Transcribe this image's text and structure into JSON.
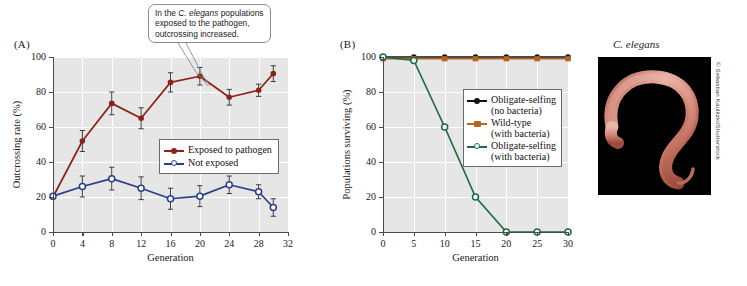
{
  "figure": {
    "panel_a_label": "(A)",
    "panel_b_label": "(B)",
    "photo_title": "C. elegans",
    "photo_credit": "© Sebastian Kaulitzki/Shutterstock",
    "callout": {
      "line1_pre": "In the ",
      "line1_italic": "C. elegans",
      "line1_post": " populations",
      "line2": "exposed to the pathogen,",
      "line3": "outcrossing increased."
    }
  },
  "colors": {
    "exposed_red": "#8c2318",
    "not_exposed_blue": "#27408b",
    "obligate_no_bacteria_black": "#111111",
    "wildtype_brown": "#b5651d",
    "obligate_with_bacteria_green": "#1f6b43",
    "plot_background": "#e6e6e6",
    "gridline": "#ffffff",
    "axis": "#4a4a4a",
    "photo_background": "#000000"
  },
  "chart_data": [
    {
      "id": "panel-a",
      "type": "line",
      "title": "",
      "xlabel": "Generation",
      "ylabel": "Outcrossing rate (%)",
      "xlim": [
        0,
        32
      ],
      "ylim": [
        0,
        100
      ],
      "xticks": [
        0,
        4,
        8,
        12,
        16,
        20,
        24,
        28,
        32
      ],
      "yticks": [
        0,
        20,
        40,
        60,
        80,
        100
      ],
      "grid": true,
      "legend_position": "center-right",
      "x": [
        0,
        4,
        8,
        12,
        16,
        20,
        24,
        28,
        30
      ],
      "series": [
        {
          "name": "Exposed to pathogen",
          "color": "#8c2318",
          "marker": "filled-circle",
          "values": [
            20,
            52,
            73.5,
            65,
            85.5,
            89,
            77,
            81,
            90.5
          ],
          "errors": [
            1,
            6,
            6.5,
            6,
            5.5,
            5,
            4.5,
            3.5,
            4.5
          ]
        },
        {
          "name": "Not exposed",
          "color": "#27408b",
          "marker": "open-circle",
          "values": [
            20.5,
            26,
            30.5,
            25,
            19,
            20.5,
            27,
            23,
            14
          ],
          "errors": [
            1,
            6,
            6.5,
            6.5,
            6,
            6,
            5,
            4,
            5
          ]
        }
      ]
    },
    {
      "id": "panel-b",
      "type": "line",
      "title": "",
      "xlabel": "Generation",
      "ylabel": "Populations surviving (%)",
      "xlim": [
        0,
        30
      ],
      "ylim": [
        0,
        100
      ],
      "xticks": [
        0,
        5,
        10,
        15,
        20,
        25,
        30
      ],
      "yticks": [
        0,
        20,
        40,
        60,
        80,
        100
      ],
      "grid": true,
      "legend_position": "center-right",
      "x": [
        0,
        5,
        10,
        15,
        20,
        25,
        30
      ],
      "series": [
        {
          "name": "Obligate-selfing",
          "sub": "(no bacteria)",
          "color": "#111111",
          "marker": "filled-circle",
          "values": [
            100,
            100,
            100,
            100,
            100,
            100,
            100
          ]
        },
        {
          "name": "Wild-type",
          "sub": "(with bacteria)",
          "color": "#b5651d",
          "marker": "filled-square",
          "values": [
            99,
            99,
            99,
            99,
            99,
            99,
            99
          ]
        },
        {
          "name": "Obligate-selfing",
          "sub": "(with bacteria)",
          "color": "#1f6b43",
          "marker": "open-circle",
          "values": [
            100,
            98,
            60,
            20,
            0,
            0,
            0
          ]
        }
      ]
    }
  ]
}
